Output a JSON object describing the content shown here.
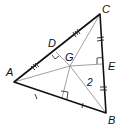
{
  "figure": {
    "vertices": {
      "A": {
        "label": "A",
        "x": 14,
        "y": 82
      },
      "B": {
        "label": "B",
        "x": 106,
        "y": 113
      },
      "C": {
        "label": "C",
        "x": 100,
        "y": 14
      }
    },
    "points": {
      "G": {
        "label": "G",
        "x": 70,
        "y": 66
      },
      "D": {
        "label": "D",
        "x": 56,
        "y": 52
      },
      "E": {
        "label": "E",
        "x": 103,
        "y": 64
      },
      "F": {
        "label": "",
        "x": 62,
        "y": 98
      }
    },
    "measurements": {
      "GB_label": "2"
    },
    "colors": {
      "side": "#111111",
      "inner": "#777777",
      "ticks": "#222222"
    }
  }
}
